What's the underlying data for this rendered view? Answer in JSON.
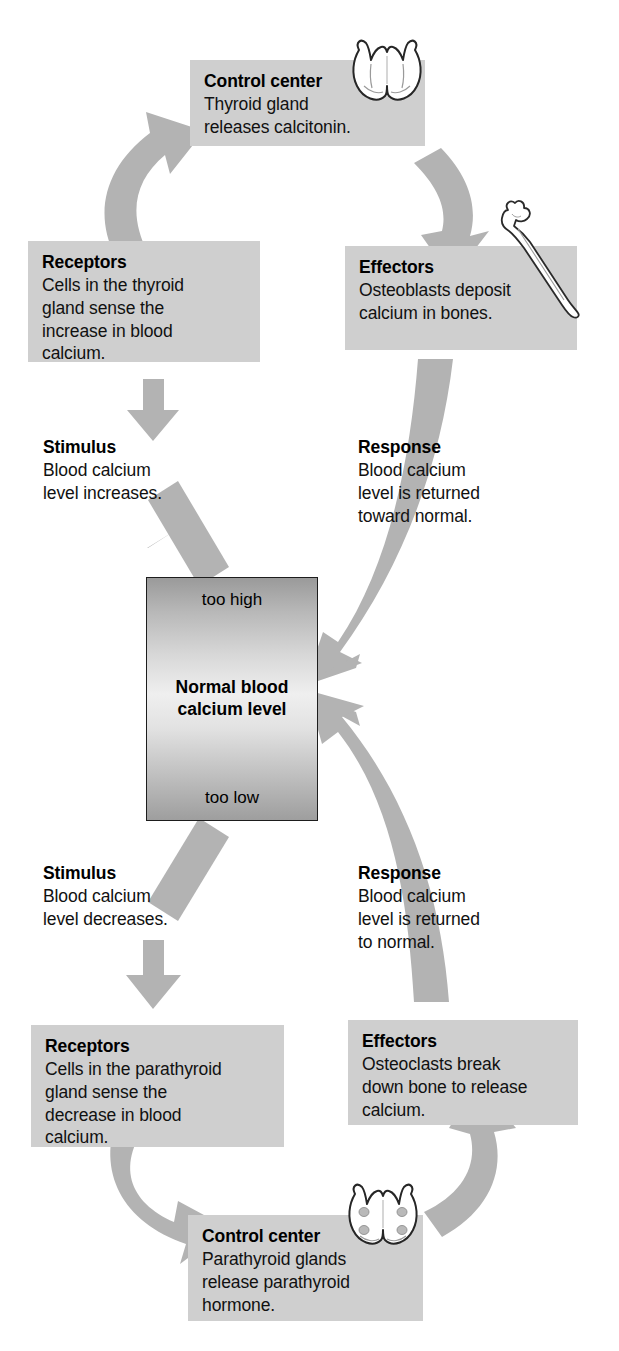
{
  "diagram": {
    "arrow_color": "#b3b3b3",
    "box_color": "#cfcfcf"
  },
  "center": {
    "top_label": "too high",
    "bottom_label": "too low",
    "middle_label": "Normal blood\ncalcium level"
  },
  "upper_loop": {
    "control_center": {
      "title": "Control center",
      "body": "Thyroid gland\nreleases calcitonin.",
      "icon": "thyroid-gland-icon"
    },
    "effectors": {
      "title": "Effectors",
      "body": "Osteoblasts deposit\ncalcium in bones.",
      "icon": "bone-icon"
    },
    "receptors": {
      "title": "Receptors",
      "body": "Cells in the thyroid\ngland sense the\nincrease in blood\ncalcium."
    },
    "stimulus": {
      "title": "Stimulus",
      "body": "Blood calcium\nlevel increases."
    },
    "response": {
      "title": "Response",
      "body": "Blood calcium\nlevel is returned\ntoward normal."
    }
  },
  "lower_loop": {
    "control_center": {
      "title": "Control center",
      "body": "Parathyroid glands\nrelease parathyroid\nhormone.",
      "icon": "parathyroid-gland-icon"
    },
    "effectors": {
      "title": "Effectors",
      "body": "Osteoclasts break\ndown bone to release\ncalcium."
    },
    "receptors": {
      "title": "Receptors",
      "body": "Cells in the parathyroid\ngland sense the\ndecrease in blood\ncalcium."
    },
    "stimulus": {
      "title": "Stimulus",
      "body": "Blood calcium\nlevel decreases."
    },
    "response": {
      "title": "Response",
      "body": "Blood calcium\nlevel is returned\nto normal."
    }
  }
}
